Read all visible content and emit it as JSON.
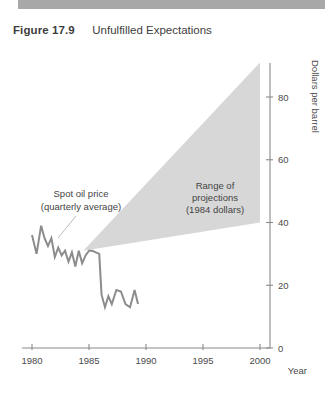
{
  "caption": {
    "figure_label": "Figure 17.9",
    "title": "Unfulfilled Expectations"
  },
  "colors": {
    "top_band": "#a8a8a8",
    "wedge_fill": "#d7d7d7",
    "series_line": "#8c8c8c",
    "axis": "#8a8a8a",
    "text": "#444444"
  },
  "chart_data": {
    "type": "line",
    "title": "Unfulfilled Expectations",
    "xlabel": "Year",
    "ylabel": "Dollars per barrel",
    "xlim": [
      1979,
      2001
    ],
    "ylim": [
      0,
      95
    ],
    "xticks": [
      1980,
      1985,
      1990,
      1995,
      2000
    ],
    "xticklabels": [
      "1980",
      "1985",
      "1990",
      "1995",
      "2000"
    ],
    "yticks": [
      0,
      20,
      40,
      60,
      80
    ],
    "yticklabels": [
      "0",
      "20",
      "40",
      "60",
      "80"
    ],
    "grid": false,
    "legend": "none",
    "series": [
      {
        "name": "Spot oil price (quarterly average)",
        "type": "line",
        "x": [
          1980.0,
          1980.4,
          1980.8,
          1981.1,
          1981.4,
          1981.7,
          1982.0,
          1982.3,
          1982.6,
          1982.9,
          1983.2,
          1983.5,
          1983.8,
          1984.1,
          1984.4,
          1984.7,
          1985.0,
          1985.3,
          1985.6,
          1985.9,
          1986.1,
          1986.4,
          1986.7,
          1987.0,
          1987.4,
          1987.8,
          1988.2,
          1988.6,
          1989.0,
          1989.3
        ],
        "y": [
          36.0,
          30.0,
          39.0,
          35.0,
          32.5,
          35.0,
          29.0,
          32.0,
          29.5,
          31.0,
          27.5,
          30.5,
          26.0,
          31.0,
          27.0,
          29.5,
          31.0,
          31.0,
          30.5,
          30.0,
          17.0,
          13.0,
          16.5,
          14.0,
          18.5,
          18.0,
          14.0,
          13.0,
          18.5,
          14.0
        ]
      }
    ],
    "bands": [
      {
        "name": "Range of projections (1984 dollars)",
        "type": "wedge",
        "apex": {
          "x": 1984.5,
          "y": 31.0
        },
        "right_edge": {
          "x": 2000.0,
          "y_top": 91.0,
          "y_bottom": 40.0
        }
      }
    ],
    "annotations": [
      {
        "id": "spot-oil-price",
        "lines": [
          "Spot oil price",
          "(quarterly average)"
        ],
        "x": 1983.0,
        "y": 56.0
      },
      {
        "id": "range-of-projections",
        "lines": [
          "Range of",
          "projections",
          "(1984 dollars)"
        ],
        "x": 1993.4,
        "y": 56.0
      }
    ]
  }
}
